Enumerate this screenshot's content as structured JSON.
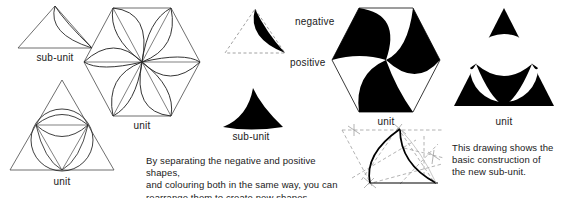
{
  "page": {
    "width": 567,
    "height": 198,
    "background": "#ffffff",
    "ink": "#000000",
    "line": "#444444"
  },
  "figures": {
    "outline_subunit_triangle": {
      "caption": "sub-unit",
      "description": "Outline triangle containing a lens formed by two arcs from apex to lower-right corner"
    },
    "outline_hexagon_unit": {
      "caption": "unit",
      "description": "Hexagon divided into six triangles each with a curved pinwheel blade"
    },
    "outline_triangle_unit": {
      "caption": "unit",
      "description": "Outline triangle with inscribed circle, medial triangle and arcs"
    },
    "negative_shape": {
      "label": "negative",
      "description": "Solid black lens shape with dashed triangle construction outline"
    },
    "positive_shape": {
      "label": "positive",
      "caption": "sub-unit",
      "description": "Solid black concave curved triangle"
    },
    "solid_hexagon_unit": {
      "caption": "unit",
      "description": "Hexagon filled with six alternating black pinwheel blades"
    },
    "solid_triangle_unit": {
      "caption": "unit",
      "description": "Solid black triangle with white circle and black inner curved triangle"
    },
    "construction_detail": {
      "description": "Construction diagram with dashed guide lines and two bold arcs forming a crescent"
    }
  },
  "text": {
    "body_note": "By separating the negative and positive shapes,\nand colouring both in the same way, you can\nrearrange them to create new shapes.",
    "side_note": "This drawing shows the\nbasic construction of\nthe new sub-unit."
  },
  "colors": {
    "fill_black": "#000000",
    "stroke_thin": "#4a4a4a",
    "stroke_bold": "#000000",
    "text": "#1a1a1a",
    "background": "#ffffff"
  }
}
